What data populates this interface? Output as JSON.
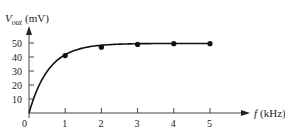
{
  "chart_data": {
    "type": "line",
    "title": "",
    "xlabel": "f (kHz)",
    "ylabel": "V_out (mV)",
    "ylabel_main": "V",
    "ylabel_sub": "out",
    "ylabel_unit": "(mV)",
    "xlabel_var": "f",
    "xlabel_unit": "(kHz)",
    "origin_label": "0",
    "x_ticks": [
      "1",
      "2",
      "3",
      "4",
      "5"
    ],
    "y_ticks": [
      "10",
      "20",
      "30",
      "40",
      "50"
    ],
    "xlim": [
      0,
      5.8
    ],
    "ylim": [
      0,
      60
    ],
    "grid": false,
    "series": [
      {
        "name": "V_out",
        "x": [
          1,
          2,
          3,
          4,
          5
        ],
        "values": [
          41,
          47,
          49,
          49.5,
          49.5
        ],
        "markers": true,
        "curve_from_origin": true
      }
    ]
  }
}
